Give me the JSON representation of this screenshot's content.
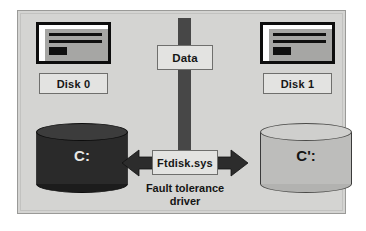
{
  "diagram": {
    "colors": {
      "panel_background": "#d4d4d2",
      "panel_border": "#9a9a98",
      "data_bar": "#474747",
      "box_fill": "#e3e3e1",
      "box_border": "#6f6f6d",
      "cylinder_dark": "#2a2a2a",
      "cylinder_light": "#bdbdbb",
      "arrow": "#2c2c2c",
      "text": "#141414"
    },
    "data_flow": {
      "label": "Data",
      "bar_name": "data-stream-bar"
    },
    "disks": [
      {
        "id": "disk0",
        "label": "Disk 0",
        "icon": "window-icon",
        "volume_label": "C:",
        "volume_style": "dark"
      },
      {
        "id": "disk1",
        "label": "Disk 1",
        "icon": "window-icon",
        "volume_label": "C':",
        "volume_style": "light"
      }
    ],
    "driver": {
      "box_label": "Ftdisk.sys",
      "caption_line1": "Fault tolerance",
      "caption_line2": "driver",
      "arrow_icon": "double-headed-arrow-icon"
    }
  }
}
